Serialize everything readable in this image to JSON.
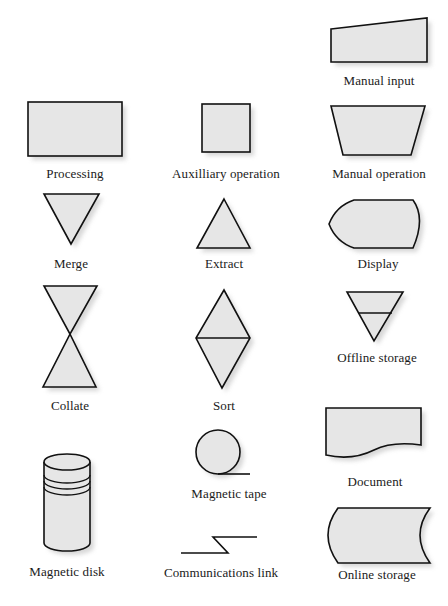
{
  "figure": {
    "type": "flowchart-symbol-legend",
    "fill_color": "#e6e6e6",
    "stroke_color": "#111111",
    "symbols": [
      {
        "id": "manual-input",
        "label": "Manual input",
        "shape": "trapezoid-slanted-top"
      },
      {
        "id": "processing",
        "label": "Processing",
        "shape": "rectangle"
      },
      {
        "id": "auxiliary-operation",
        "label": "Auxilliary operation",
        "shape": "square"
      },
      {
        "id": "manual-operation",
        "label": "Manual operation",
        "shape": "inverted-trapezoid"
      },
      {
        "id": "merge",
        "label": "Merge",
        "shape": "inverted-triangle"
      },
      {
        "id": "extract",
        "label": "Extract",
        "shape": "triangle"
      },
      {
        "id": "display",
        "label": "Display",
        "shape": "display"
      },
      {
        "id": "collate",
        "label": "Collate",
        "shape": "hourglass"
      },
      {
        "id": "sort",
        "label": "Sort",
        "shape": "diamond-split"
      },
      {
        "id": "offline-storage",
        "label": "Offline storage",
        "shape": "inverted-triangle-with-bar"
      },
      {
        "id": "document",
        "label": "Document",
        "shape": "document"
      },
      {
        "id": "magnetic-tape",
        "label": "Magnetic tape",
        "shape": "circle-with-tail"
      },
      {
        "id": "magnetic-disk",
        "label": "Magnetic disk",
        "shape": "cylinder"
      },
      {
        "id": "communications-link",
        "label": "Communications link",
        "shape": "lightning-line"
      },
      {
        "id": "online-storage",
        "label": "Online storage",
        "shape": "online-storage"
      }
    ]
  }
}
